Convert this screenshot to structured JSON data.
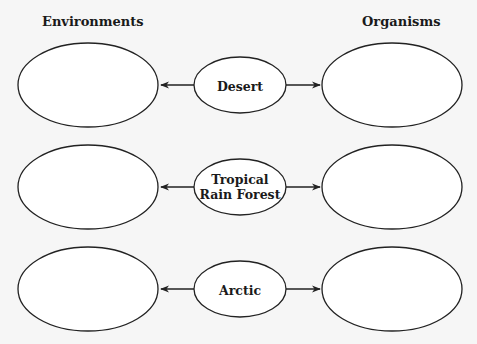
{
  "headings": {
    "left": "Environments",
    "right": "Organisms"
  },
  "rows": [
    {
      "center_label": "Desert",
      "left_blank": "",
      "right_blank": ""
    },
    {
      "center_label": "Tropical\nRain Forest",
      "center_line1": "Tropical",
      "center_line2": "Rain Forest",
      "left_blank": "",
      "right_blank": ""
    },
    {
      "center_label": "Arctic",
      "left_blank": "",
      "right_blank": ""
    }
  ],
  "colors": {
    "background": "#f6f6f6",
    "stroke": "#222222",
    "text": "#1a1a1a"
  }
}
